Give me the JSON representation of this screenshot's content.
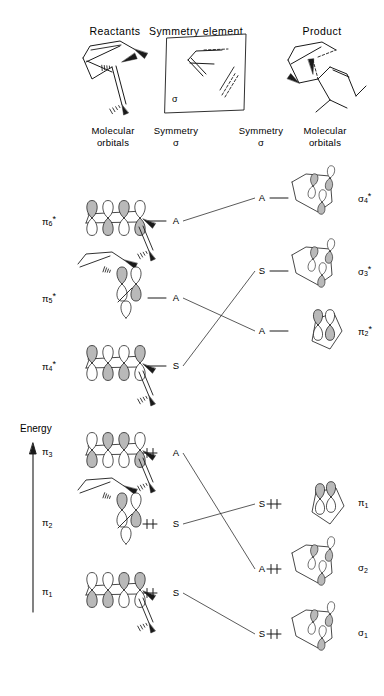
{
  "figure": {
    "title_top_headers": {
      "reactants": "Reactants",
      "symmetry_element": "Symmetry element",
      "product": "Product"
    },
    "column_headers": {
      "left_mo_line1": "Molecular",
      "left_mo_line2": "orbitals",
      "left_sym_line1": "Symmetry",
      "left_sym_line2": "σ",
      "right_sym_line1": "Symmetry",
      "right_sym_line2": "σ",
      "right_mo_line1": "Molecular",
      "right_mo_line2": "orbitals"
    },
    "axis": {
      "energy_label": "Energy",
      "direction": "up"
    },
    "mirror_plane_label": "σ",
    "colors": {
      "stroke": "#1a1a1a",
      "orbital_shaded": "#b9b9b9",
      "orbital_empty": "#ffffff",
      "background": "#ffffff"
    },
    "reactant_levels": [
      {
        "id": "pi6s",
        "orbital_label": "π",
        "sub": "6",
        "star": "*",
        "symmetry": "A",
        "electrons": 0,
        "y": 221
      },
      {
        "id": "pi5s",
        "orbital_label": "π",
        "sub": "5",
        "star": "*",
        "symmetry": "A",
        "electrons": 0,
        "y": 298
      },
      {
        "id": "pi4s",
        "orbital_label": "π",
        "sub": "4",
        "star": "*",
        "symmetry": "S",
        "electrons": 0,
        "y": 366
      },
      {
        "id": "pi3",
        "orbital_label": "π",
        "sub": "3",
        "star": "",
        "symmetry": "A",
        "electrons": 2,
        "y": 453
      },
      {
        "id": "pi2",
        "orbital_label": "π",
        "sub": "2",
        "star": "",
        "symmetry": "S",
        "electrons": 2,
        "y": 524
      },
      {
        "id": "pi1",
        "orbital_label": "π",
        "sub": "1",
        "star": "",
        "symmetry": "S",
        "electrons": 2,
        "y": 593
      }
    ],
    "product_levels": [
      {
        "id": "sig4s",
        "orbital_label": "σ",
        "sub": "4",
        "star": "*",
        "symmetry": "A",
        "electrons": 0,
        "y": 198
      },
      {
        "id": "sig3s",
        "orbital_label": "σ",
        "sub": "3",
        "star": "*",
        "symmetry": "S",
        "electrons": 0,
        "y": 271
      },
      {
        "id": "pi2s",
        "orbital_label": "π",
        "sub": "2",
        "star": "*",
        "symmetry": "A",
        "electrons": 0,
        "y": 331
      },
      {
        "id": "pi1p",
        "orbital_label": "π",
        "sub": "1",
        "star": "",
        "symmetry": "S",
        "electrons": 2,
        "y": 504
      },
      {
        "id": "sig2",
        "orbital_label": "σ",
        "sub": "2",
        "star": "",
        "symmetry": "A",
        "electrons": 2,
        "y": 569
      },
      {
        "id": "sig1",
        "orbital_label": "σ",
        "sub": "1",
        "star": "",
        "symmetry": "S",
        "electrons": 2,
        "y": 634
      }
    ],
    "correlations": [
      {
        "from": "pi6s",
        "to": "sig4s",
        "from_symmetry": "A",
        "to_symmetry": "A"
      },
      {
        "from": "pi5s",
        "to": "pi2s",
        "from_symmetry": "A",
        "to_symmetry": "A"
      },
      {
        "from": "pi4s",
        "to": "sig3s",
        "from_symmetry": "S",
        "to_symmetry": "S"
      },
      {
        "from": "pi3",
        "to": "sig2",
        "from_symmetry": "A",
        "to_symmetry": "A"
      },
      {
        "from": "pi2",
        "to": "pi1p",
        "from_symmetry": "S",
        "to_symmetry": "S"
      },
      {
        "from": "pi1",
        "to": "sig1",
        "from_symmetry": "S",
        "to_symmetry": "S"
      }
    ]
  }
}
